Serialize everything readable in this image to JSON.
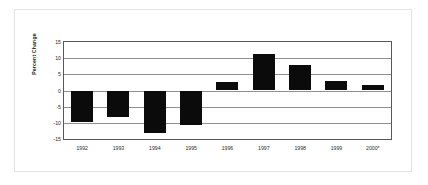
{
  "chart_data": {
    "type": "bar",
    "title": "",
    "subtitle": "",
    "xlabel": "",
    "ylabel": "Percent Change",
    "categories": [
      "1992",
      "1993",
      "1994",
      "1995",
      "1996",
      "1997",
      "1998",
      "1999",
      "2000*"
    ],
    "values": [
      -9.8,
      -8.2,
      -13.2,
      -10.7,
      2.7,
      11.2,
      7.8,
      3.0,
      1.8
    ],
    "series": [
      {
        "name": "Percent Change",
        "values": [
          -9.8,
          -8.2,
          -13.2,
          -10.7,
          2.7,
          11.2,
          7.8,
          3.0,
          1.8
        ],
        "color": "#0b0b0b"
      }
    ],
    "ylim": [
      -15,
      15
    ],
    "yticks": [
      15,
      10,
      5,
      0,
      -5,
      -10,
      -15
    ],
    "ytick_labels": [
      "15",
      "10",
      "5",
      "0",
      "-5",
      "-10",
      "-15"
    ],
    "grid": true,
    "grid_axis": "y",
    "legend": false,
    "legend_position": "none",
    "annotations": [
      "* denotes preliminary / partial-year data"
    ],
    "bar_color": "#0b0b0b",
    "axis_color": "#55585c",
    "gridline_color": "#8d9095",
    "plot_background": "#ffffff",
    "frame_color": "#e3e3e3"
  }
}
